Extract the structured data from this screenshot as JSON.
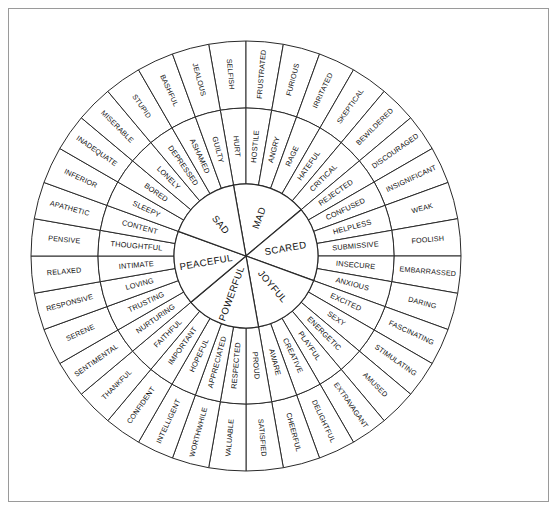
{
  "figure": {
    "kind": "feelings-wheel-diagram",
    "background_color": "#ffffff",
    "border_color": "#9a9a9a",
    "line_color": "#2a2a2a",
    "text_color": "#101010"
  },
  "chart_data": {
    "type": "pie",
    "title": "",
    "rings": [
      "core",
      "middle",
      "outer"
    ],
    "legend": "none",
    "grid": false,
    "segments_per_ring": [
      6,
      36,
      36
    ],
    "categories": [
      "MAD",
      "SCARED",
      "JOYFUL",
      "POWERFUL",
      "PEACEFUL",
      "SAD"
    ],
    "values": [
      1,
      1,
      1,
      1,
      1,
      1
    ],
    "core": [
      {
        "label": "MAD",
        "index": 0
      },
      {
        "label": "SCARED",
        "index": 1
      },
      {
        "label": "JOYFUL",
        "index": 2
      },
      {
        "label": "POWERFUL",
        "index": 3
      },
      {
        "label": "PEACEFUL",
        "index": 4
      },
      {
        "label": "SAD",
        "index": 5
      }
    ],
    "middle": [
      "HURT",
      "HOSTILE",
      "ANGRY",
      "RAGE",
      "HATEFUL",
      "CRITICAL",
      "REJECTED",
      "CONFUSED",
      "HELPLESS",
      "SUBMISSIVE",
      "INSECURE",
      "ANXIOUS",
      "EXCITED",
      "SEXY",
      "ENERGETIC",
      "PLAYFUL",
      "CREATIVE",
      "AWARE",
      "PROUD",
      "RESPECTED",
      "APPRECIATED",
      "HOPEFUL",
      "IMPORTANT",
      "FAITHFUL",
      "NURTURING",
      "TRUSTING",
      "LOVING",
      "INTIMATE",
      "THOUGHTFUL",
      "CONTENT",
      "SLEEPY",
      "BORED",
      "LONELY",
      "DEPRESSED",
      "ASHAMED",
      "GUILTY"
    ],
    "outer": [
      "SELFISH",
      "FRUSTRATED",
      "FURIOUS",
      "IRRITATED",
      "SKEPTICAL",
      "BEWILDERED",
      "DISCOURAGED",
      "INSIGNIFICANT",
      "WEAK",
      "FOOLISH",
      "EMBARRASSED",
      "DARING",
      "FASCINATING",
      "STIMULATING",
      "AMUSED",
      "EXTRAVAGANT",
      "DELIGHTFUL",
      "CHEERFUL",
      "SATISFIED",
      "VALUABLE",
      "WORTHWHILE",
      "INTELLIGENT",
      "CONFIDENT",
      "THANKFUL",
      "SENTIMENTAL",
      "SERENE",
      "RESPONSIVE",
      "RELAXED",
      "PENSIVE",
      "APATHETIC",
      "INFERIOR",
      "INADEQUATE",
      "MISERABLE",
      "STUPID",
      "BASHFUL",
      "JEALOUS"
    ],
    "groups": [
      {
        "core": "MAD",
        "middle": [
          "HURT",
          "HOSTILE",
          "ANGRY",
          "RAGE",
          "HATEFUL",
          "CRITICAL"
        ],
        "outer": [
          "SELFISH",
          "FRUSTRATED",
          "FURIOUS",
          "IRRITATED",
          "SKEPTICAL",
          "BEWILDERED"
        ]
      },
      {
        "core": "SCARED",
        "middle": [
          "REJECTED",
          "CONFUSED",
          "HELPLESS",
          "SUBMISSIVE",
          "INSECURE",
          "ANXIOUS"
        ],
        "outer": [
          "DISCOURAGED",
          "INSIGNIFICANT",
          "WEAK",
          "FOOLISH",
          "EMBARRASSED",
          "DARING"
        ]
      },
      {
        "core": "JOYFUL",
        "middle": [
          "EXCITED",
          "SEXY",
          "ENERGETIC",
          "PLAYFUL",
          "CREATIVE",
          "AWARE"
        ],
        "outer": [
          "FASCINATING",
          "STIMULATING",
          "AMUSED",
          "EXTRAVAGANT",
          "DELIGHTFUL",
          "CHEERFUL"
        ]
      },
      {
        "core": "POWERFUL",
        "middle": [
          "PROUD",
          "RESPECTED",
          "APPRECIATED",
          "HOPEFUL",
          "IMPORTANT",
          "FAITHFUL"
        ],
        "outer": [
          "SATISFIED",
          "VALUABLE",
          "WORTHWHILE",
          "INTELLIGENT",
          "CONFIDENT",
          "THANKFUL"
        ]
      },
      {
        "core": "PEACEFUL",
        "middle": [
          "NURTURING",
          "TRUSTING",
          "LOVING",
          "INTIMATE",
          "THOUGHTFUL",
          "CONTENT"
        ],
        "outer": [
          "SENTIMENTAL",
          "SERENE",
          "RESPONSIVE",
          "RELAXED",
          "PENSIVE",
          "APATHETIC"
        ]
      },
      {
        "core": "SAD",
        "middle": [
          "SLEEPY",
          "BORED",
          "LONELY",
          "DEPRESSED",
          "ASHAMED",
          "GUILTY"
        ],
        "outer": [
          "INFERIOR",
          "INADEQUATE",
          "MISERABLE",
          "STUPID",
          "BASHFUL",
          "JEALOUS"
        ]
      }
    ]
  }
}
